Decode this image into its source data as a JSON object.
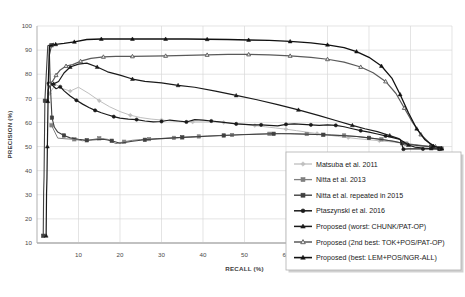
{
  "chart_data": {
    "type": "line",
    "title": "",
    "xlabel": "RECALL (%)",
    "ylabel": "PRECISION (%)",
    "xlim": [
      0,
      100
    ],
    "ylim": [
      10,
      100
    ],
    "xticks": [
      10,
      20,
      30,
      40,
      50,
      60,
      70,
      80,
      90,
      100
    ],
    "yticks": [
      10,
      20,
      30,
      40,
      50,
      60,
      70,
      80,
      90,
      100
    ],
    "grid": true,
    "legend_position": "bottom-right",
    "series": [
      {
        "name": "Matsuba et al. 2011",
        "color": "#bfbfbf",
        "marker": "diamond",
        "marker_filled": true,
        "line_width": 1.0,
        "points": [
          [
            3.0,
            72.0
          ],
          [
            4.5,
            75.8
          ],
          [
            6.2,
            74.0
          ],
          [
            8.0,
            73.0
          ],
          [
            10.0,
            74.6
          ],
          [
            12.5,
            72.0
          ],
          [
            15.0,
            69.0
          ],
          [
            17.5,
            66.5
          ],
          [
            20.0,
            64.5
          ],
          [
            22.5,
            63.0
          ],
          [
            25.0,
            62.0
          ],
          [
            27.5,
            61.4
          ],
          [
            30.0,
            61.0
          ],
          [
            32.5,
            60.6
          ],
          [
            35.0,
            60.3
          ],
          [
            37.5,
            60.2
          ],
          [
            40.0,
            60.2
          ],
          [
            42.5,
            60.2
          ],
          [
            45.0,
            60.0
          ],
          [
            47.5,
            59.6
          ],
          [
            50.0,
            59.2
          ],
          [
            52.5,
            58.7
          ],
          [
            55.0,
            58.2
          ],
          [
            57.5,
            57.7
          ],
          [
            60.0,
            57.2
          ],
          [
            62.5,
            56.6
          ],
          [
            65.0,
            56.0
          ],
          [
            67.5,
            55.4
          ],
          [
            70.0,
            54.8
          ],
          [
            72.5,
            54.2
          ],
          [
            75.0,
            53.7
          ],
          [
            77.5,
            53.2
          ],
          [
            80.0,
            52.8
          ],
          [
            82.5,
            52.4
          ],
          [
            85.0,
            52.0
          ],
          [
            87.0,
            51.6
          ],
          [
            89.0,
            51.2
          ],
          [
            91.0,
            50.8
          ],
          [
            93.0,
            50.4
          ],
          [
            95.0,
            50.0
          ],
          [
            96.5,
            49.6
          ],
          [
            97.5,
            49.2
          ]
        ]
      },
      {
        "name": "Nitta et al. 2013",
        "color": "#808080",
        "marker": "square",
        "marker_filled": true,
        "line_width": 1.0,
        "points": [
          [
            3.5,
            58.8
          ],
          [
            5.0,
            53.5
          ],
          [
            7.0,
            53.2
          ],
          [
            9.0,
            53.0
          ],
          [
            11.0,
            52.4
          ],
          [
            13.0,
            52.8
          ],
          [
            15.0,
            53.4
          ],
          [
            17.0,
            53.0
          ],
          [
            19.0,
            51.2
          ],
          [
            21.0,
            52.0
          ],
          [
            23.0,
            52.6
          ],
          [
            25.0,
            52.9
          ],
          [
            27.0,
            53.1
          ],
          [
            29.0,
            53.3
          ],
          [
            31.0,
            53.4
          ],
          [
            33.0,
            53.6
          ],
          [
            35.0,
            53.8
          ],
          [
            37.0,
            54.0
          ],
          [
            39.0,
            54.2
          ],
          [
            41.0,
            54.4
          ],
          [
            44.0,
            54.6
          ],
          [
            47.0,
            54.8
          ],
          [
            50.0,
            55.0
          ],
          [
            53.0,
            55.2
          ],
          [
            56.0,
            55.3
          ],
          [
            59.0,
            55.4
          ],
          [
            62.0,
            55.3
          ],
          [
            65.0,
            55.2
          ],
          [
            68.0,
            55.0
          ],
          [
            71.0,
            54.8
          ],
          [
            74.0,
            54.6
          ],
          [
            77.0,
            54.2
          ],
          [
            80.0,
            53.6
          ],
          [
            83.0,
            53.0
          ],
          [
            85.0,
            52.4
          ],
          [
            87.0,
            51.8
          ],
          [
            89.0,
            51.2
          ],
          [
            91.0,
            50.8
          ],
          [
            93.0,
            50.4
          ],
          [
            95.0,
            50.0
          ],
          [
            96.5,
            49.6
          ],
          [
            97.5,
            49.2
          ]
        ]
      },
      {
        "name": "Nitta et al. repeated in 2015",
        "color": "#404040",
        "marker": "square",
        "marker_filled": true,
        "line_width": 1.1,
        "points": [
          [
            1.5,
            13.0
          ],
          [
            1.6,
            31.0
          ],
          [
            1.7,
            37.5
          ],
          [
            1.9,
            69.0
          ],
          [
            2.6,
            91.8
          ],
          [
            4.0,
            92.8
          ],
          [
            3.5,
            92.0
          ],
          [
            3.0,
            88.0
          ],
          [
            3.2,
            76.0
          ],
          [
            3.6,
            62.0
          ],
          [
            4.2,
            58.0
          ],
          [
            5.0,
            56.0
          ],
          [
            6.5,
            54.6
          ],
          [
            8.0,
            53.6
          ],
          [
            10.0,
            53.0
          ],
          [
            12.0,
            52.6
          ],
          [
            14.0,
            52.8
          ],
          [
            16.0,
            53.0
          ],
          [
            18.0,
            52.4
          ],
          [
            20.0,
            51.4
          ],
          [
            23.0,
            52.2
          ],
          [
            26.0,
            52.8
          ],
          [
            29.0,
            53.2
          ],
          [
            32.0,
            53.5
          ],
          [
            35.0,
            53.8
          ],
          [
            38.0,
            54.0
          ],
          [
            41.0,
            54.3
          ],
          [
            45.0,
            54.6
          ],
          [
            49.0,
            54.9
          ],
          [
            53.0,
            55.1
          ],
          [
            57.0,
            55.3
          ],
          [
            61.0,
            55.3
          ],
          [
            65.0,
            55.1
          ],
          [
            69.0,
            54.9
          ],
          [
            73.0,
            54.6
          ],
          [
            77.0,
            54.2
          ],
          [
            80.0,
            53.6
          ],
          [
            83.0,
            52.9
          ],
          [
            86.0,
            52.2
          ],
          [
            88.0,
            51.4
          ],
          [
            90.0,
            50.8
          ],
          [
            92.5,
            50.3
          ],
          [
            95.0,
            49.9
          ],
          [
            97.0,
            49.3
          ]
        ]
      },
      {
        "name": "Ptaszynski et al. 2016",
        "color": "#1a1a1a",
        "marker": "circle",
        "marker_filled": true,
        "line_width": 1.2,
        "points": [
          [
            2.8,
            76.2
          ],
          [
            3.6,
            75.6
          ],
          [
            4.6,
            74.0
          ],
          [
            5.6,
            74.8
          ],
          [
            6.6,
            73.0
          ],
          [
            8.0,
            71.0
          ],
          [
            9.5,
            69.2
          ],
          [
            11.0,
            67.6
          ],
          [
            12.5,
            66.2
          ],
          [
            14.0,
            65.0
          ],
          [
            15.5,
            64.0
          ],
          [
            17.0,
            63.2
          ],
          [
            18.5,
            62.4
          ],
          [
            20.0,
            61.8
          ],
          [
            22.0,
            61.4
          ],
          [
            24.0,
            61.2
          ],
          [
            26.0,
            60.6
          ],
          [
            28.0,
            60.2
          ],
          [
            30.0,
            60.4
          ],
          [
            32.0,
            61.0
          ],
          [
            34.0,
            60.6
          ],
          [
            36.0,
            60.2
          ],
          [
            38.0,
            61.2
          ],
          [
            40.0,
            61.0
          ],
          [
            42.0,
            60.6
          ],
          [
            44.0,
            60.2
          ],
          [
            46.0,
            59.8
          ],
          [
            48.0,
            59.4
          ],
          [
            50.0,
            59.2
          ],
          [
            52.0,
            59.0
          ],
          [
            54.0,
            59.0
          ],
          [
            56.0,
            58.8
          ],
          [
            58.0,
            58.6
          ],
          [
            60.0,
            59.2
          ],
          [
            62.0,
            59.4
          ],
          [
            64.0,
            59.2
          ],
          [
            66.0,
            59.0
          ],
          [
            68.0,
            58.8
          ],
          [
            70.0,
            59.0
          ],
          [
            72.0,
            58.8
          ],
          [
            74.0,
            58.2
          ],
          [
            76.0,
            57.4
          ],
          [
            78.0,
            56.6
          ],
          [
            80.0,
            56.0
          ],
          [
            82.0,
            55.2
          ],
          [
            84.0,
            54.4
          ],
          [
            86.0,
            53.6
          ],
          [
            87.5,
            53.0
          ],
          [
            88.3,
            48.9
          ],
          [
            89.5,
            49.0
          ],
          [
            91.0,
            49.0
          ],
          [
            93.0,
            49.0
          ],
          [
            95.0,
            49.0
          ],
          [
            97.0,
            49.0
          ]
        ]
      },
      {
        "name": "Proposed (worst: CHUNK/PAT-OP)",
        "color": "#1a1a1a",
        "marker": "triangle",
        "marker_filled": true,
        "line_width": 1.2,
        "points": [
          [
            2.2,
            13.0
          ],
          [
            2.3,
            30.5
          ],
          [
            2.4,
            37.0
          ],
          [
            2.5,
            50.0
          ],
          [
            2.7,
            73.5
          ],
          [
            3.2,
            76.2
          ],
          [
            4.0,
            76.0
          ],
          [
            5.2,
            77.0
          ],
          [
            6.5,
            80.5
          ],
          [
            8.0,
            83.0
          ],
          [
            10.0,
            84.2
          ],
          [
            12.0,
            84.6
          ],
          [
            14.5,
            83.0
          ],
          [
            17.0,
            81.0
          ],
          [
            20.0,
            79.6
          ],
          [
            23.0,
            78.0
          ],
          [
            26.0,
            77.0
          ],
          [
            30.0,
            76.4
          ],
          [
            34.0,
            75.4
          ],
          [
            38.0,
            74.6
          ],
          [
            43.0,
            73.0
          ],
          [
            48.0,
            71.2
          ],
          [
            53.0,
            69.4
          ],
          [
            58.0,
            67.4
          ],
          [
            63.0,
            65.2
          ],
          [
            68.0,
            62.8
          ],
          [
            72.0,
            60.8
          ],
          [
            76.0,
            58.8
          ],
          [
            79.0,
            57.4
          ],
          [
            82.0,
            56.2
          ],
          [
            85.0,
            54.6
          ],
          [
            87.0,
            53.4
          ],
          [
            88.3,
            52.0
          ],
          [
            89.5,
            50.6
          ],
          [
            91.0,
            49.8
          ],
          [
            93.0,
            49.4
          ],
          [
            95.0,
            49.2
          ],
          [
            97.0,
            49.0
          ]
        ]
      },
      {
        "name": "Proposed (2nd best: TOK+POS/PAT-OP)",
        "color": "#5a5a5a",
        "marker": "triangle-open",
        "marker_filled": false,
        "line_width": 1.2,
        "points": [
          [
            3.0,
            75.8
          ],
          [
            3.8,
            77.2
          ],
          [
            4.6,
            79.6
          ],
          [
            5.6,
            81.8
          ],
          [
            7.0,
            83.4
          ],
          [
            8.6,
            84.0
          ],
          [
            10.5,
            85.4
          ],
          [
            13.0,
            86.6
          ],
          [
            16.0,
            87.2
          ],
          [
            19.0,
            87.4
          ],
          [
            23.0,
            87.4
          ],
          [
            27.0,
            87.5
          ],
          [
            31.0,
            87.6
          ],
          [
            36.0,
            87.8
          ],
          [
            41.0,
            88.0
          ],
          [
            46.0,
            88.2
          ],
          [
            51.0,
            88.2
          ],
          [
            56.0,
            88.0
          ],
          [
            61.0,
            87.6
          ],
          [
            66.0,
            87.0
          ],
          [
            70.0,
            86.2
          ],
          [
            74.0,
            85.0
          ],
          [
            78.0,
            83.0
          ],
          [
            81.0,
            80.6
          ],
          [
            84.0,
            77.0
          ],
          [
            86.5,
            72.0
          ],
          [
            88.5,
            66.0
          ],
          [
            90.5,
            60.0
          ],
          [
            92.5,
            55.0
          ],
          [
            94.5,
            51.6
          ],
          [
            96.0,
            50.0
          ],
          [
            97.5,
            49.2
          ]
        ]
      },
      {
        "name": "Proposed (best: LEM+POS/NGR-ALL)",
        "color": "#111111",
        "marker": "triangle",
        "marker_filled": true,
        "line_width": 1.3,
        "points": [
          [
            2.6,
            68.8
          ],
          [
            3.0,
            91.8
          ],
          [
            4.5,
            92.4
          ],
          [
            6.5,
            92.8
          ],
          [
            9.0,
            93.4
          ],
          [
            12.0,
            94.4
          ],
          [
            15.5,
            94.6
          ],
          [
            19.0,
            94.6
          ],
          [
            23.0,
            94.6
          ],
          [
            27.0,
            94.6
          ],
          [
            31.0,
            94.6
          ],
          [
            36.0,
            94.6
          ],
          [
            41.0,
            94.5
          ],
          [
            46.0,
            94.4
          ],
          [
            51.0,
            94.2
          ],
          [
            56.0,
            94.0
          ],
          [
            61.0,
            93.6
          ],
          [
            66.0,
            93.0
          ],
          [
            70.0,
            92.2
          ],
          [
            74.0,
            91.0
          ],
          [
            77.0,
            89.4
          ],
          [
            80.0,
            87.0
          ],
          [
            83.0,
            83.4
          ],
          [
            85.5,
            78.4
          ],
          [
            87.5,
            71.6
          ],
          [
            89.5,
            64.0
          ],
          [
            91.5,
            57.4
          ],
          [
            93.5,
            52.8
          ],
          [
            95.5,
            50.2
          ],
          [
            97.5,
            49.2
          ]
        ]
      }
    ]
  },
  "legend": {
    "entries": [
      {
        "label": "Matsuba et al. 2011"
      },
      {
        "label": "Nitta et al. 2013"
      },
      {
        "label": "Nitta et al. repeated in 2015"
      },
      {
        "label": "Ptaszynski et al. 2016"
      },
      {
        "label": "Proposed (worst: CHUNK/PAT-OP)"
      },
      {
        "label": "Proposed (2nd best: TOK+POS/PAT-OP)"
      },
      {
        "label": "Proposed (best: LEM+POS/NGR-ALL)"
      }
    ]
  },
  "axes": {
    "x_title": "RECALL (%)",
    "y_title": "PRECISION (%)"
  }
}
